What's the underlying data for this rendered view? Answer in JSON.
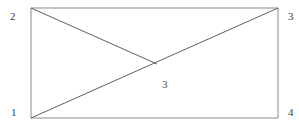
{
  "figure": {
    "type": "line-diagram",
    "width": 299,
    "height": 135,
    "background_color": "#ffffff",
    "stroke_color": "#6e6e6e",
    "stroke_color_dark": "#4f4f4f",
    "stroke_width": 1,
    "rectangle": {
      "name": "outer-rectangle",
      "top_left": [
        31,
        8
      ],
      "top_right": [
        278,
        8
      ],
      "bottom_right": [
        278,
        118
      ],
      "bottom_left": [
        31,
        118
      ]
    },
    "lines": [
      {
        "name": "main-diagonal",
        "from": [
          31,
          118
        ],
        "to": [
          278,
          8
        ],
        "description": "diagonal from bottom-left corner to top-right corner"
      },
      {
        "name": "secondary-segment",
        "from": [
          31,
          8
        ],
        "to": [
          157,
          64
        ],
        "description": "segment from top-left corner terminating on the main diagonal"
      }
    ],
    "intersection_point": [
      157,
      64
    ],
    "labels": {
      "vertex_bottom_left": "1",
      "vertex_top_left": "2",
      "vertex_top_right": "3",
      "vertex_bottom_right": "4",
      "interior_node": "3"
    }
  }
}
